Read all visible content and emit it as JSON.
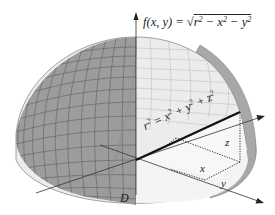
{
  "figure": {
    "function_label": "f(x, y) = √(r² − x² − y²)",
    "function_parts": {
      "lhs": "f(x, y) = ",
      "radicand": "r2 − x2 − y2"
    },
    "equation_label": "r² = x² + y² + z²",
    "axis_labels": {
      "z": "z",
      "x": "x",
      "y": "y"
    },
    "region_label": "D",
    "colors": {
      "shaded_surface": "#9a9a9a",
      "grid_lines": "#5f5f5f",
      "cutaway_fill": "#f1f1f1",
      "radius_line": "#111111",
      "axes": "#333333"
    }
  }
}
